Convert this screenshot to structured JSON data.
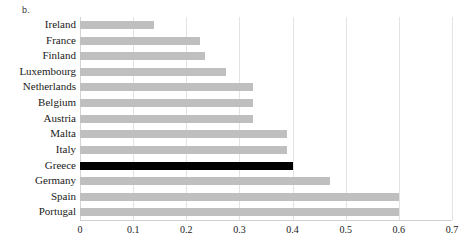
{
  "panel": {
    "label": "b."
  },
  "chart_data": {
    "type": "bar",
    "orientation": "horizontal",
    "title": "",
    "subtitle": "",
    "xlabel": "",
    "ylabel": "",
    "xlim": [
      0,
      0.7
    ],
    "xticks": [
      0,
      0.1,
      0.2,
      0.3,
      0.4,
      0.5,
      0.6,
      0.7
    ],
    "xtick_labels": [
      "0",
      "0.1",
      "0.2",
      "0.3",
      "0.4",
      "0.5",
      "0.6",
      "0.7"
    ],
    "grid": "vertical",
    "legend": "none",
    "bar_color": "#BFBFBF",
    "highlight_color": "#000000",
    "highlight_category": "Greece",
    "categories": [
      "Ireland",
      "France",
      "Finland",
      "Luxembourg",
      "Netherlands",
      "Belgium",
      "Austria",
      "Malta",
      "Italy",
      "Greece",
      "Germany",
      "Spain",
      "Portugal"
    ],
    "values": [
      0.14,
      0.225,
      0.235,
      0.275,
      0.325,
      0.325,
      0.325,
      0.39,
      0.39,
      0.4,
      0.47,
      0.6,
      0.6
    ]
  }
}
